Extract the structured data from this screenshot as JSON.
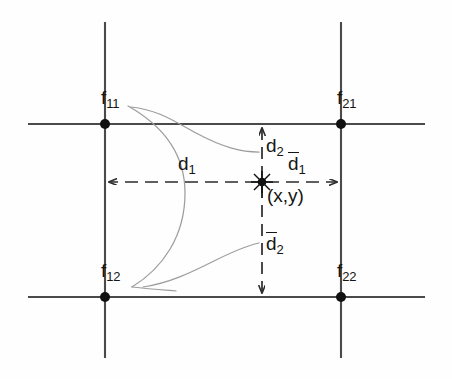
{
  "figure": {
    "background_color": "#fefefe",
    "grid_line_color": "#4a4a4a",
    "curve_color": "#9a9a9a",
    "node_color": "#111111",
    "text_color": "#151515"
  },
  "corner_nodes": [
    {
      "id": "f11",
      "base": "f",
      "subscript": "11",
      "label": "f11",
      "x": 105,
      "y": 124,
      "label_x": 101,
      "label_y": 90
    },
    {
      "id": "f21",
      "base": "f",
      "subscript": "21",
      "label": "f21",
      "x": 341,
      "y": 124,
      "label_x": 337,
      "label_y": 90
    },
    {
      "id": "f12",
      "base": "f",
      "subscript": "12",
      "label": "f12",
      "x": 105,
      "y": 297,
      "label_x": 101,
      "label_y": 263
    },
    {
      "id": "f22",
      "base": "f",
      "subscript": "22",
      "label": "f22",
      "x": 341,
      "y": 297,
      "label_x": 337,
      "label_y": 263
    }
  ],
  "sample_point": {
    "id": "xy",
    "label": "(x,y)",
    "x": 262,
    "y": 182,
    "label_x": 266,
    "label_y": 186,
    "marker": "star-burst"
  },
  "distance_labels": [
    {
      "id": "d1",
      "base": "d",
      "subscript": "1",
      "overbar": false,
      "label": "d1",
      "label_x": 178,
      "label_y": 155
    },
    {
      "id": "d1bar",
      "base": "d",
      "subscript": "1",
      "overbar": true,
      "label": "d1bar",
      "label_x": 291,
      "label_y": 155
    },
    {
      "id": "d2",
      "base": "d",
      "subscript": "2",
      "overbar": false,
      "label": "d2",
      "label_x": 266,
      "label_y": 137
    },
    {
      "id": "d2bar",
      "base": "d",
      "subscript": "2",
      "overbar": true,
      "label": "d2bar",
      "label_x": 266,
      "label_y": 234
    }
  ],
  "grid_lines": {
    "horizontal": [
      {
        "id": "top-row-line",
        "y": 124,
        "x1": 28,
        "x2": 425
      },
      {
        "id": "bottom-row-line",
        "y": 297,
        "x1": 28,
        "x2": 425
      }
    ],
    "vertical": [
      {
        "id": "left-col-line",
        "x": 105,
        "y1": 22,
        "y2": 358
      },
      {
        "id": "right-col-line",
        "x": 341,
        "y1": 22,
        "y2": 358
      }
    ]
  },
  "dimension_arrows": [
    {
      "id": "d1-arrow",
      "orientation": "horizontal",
      "from_x": 105,
      "to_x": 262,
      "y": 182,
      "style": "dashed",
      "arrow_at": "both"
    },
    {
      "id": "d1bar-arrow",
      "orientation": "horizontal",
      "from_x": 262,
      "to_x": 341,
      "y": 182,
      "style": "dashed",
      "arrow_at": "both"
    },
    {
      "id": "d2-arrow",
      "orientation": "vertical",
      "from_y": 124,
      "to_y": 182,
      "x": 262,
      "style": "dashed",
      "arrow_at": "both"
    },
    {
      "id": "d2bar-arrow",
      "orientation": "vertical",
      "from_y": 182,
      "to_y": 297,
      "x": 262,
      "style": "dashed",
      "arrow_at": "both"
    }
  ],
  "interpolation_curves": [
    {
      "id": "upper-curve",
      "description": "curve from f11 sweeping right and down toward d2 region"
    },
    {
      "id": "lower-curve",
      "description": "curve from f12 sweeping right and up toward d2bar region"
    },
    {
      "id": "connecting-curve",
      "description": "curve bulging right joining f11 region to f12 region"
    }
  ]
}
